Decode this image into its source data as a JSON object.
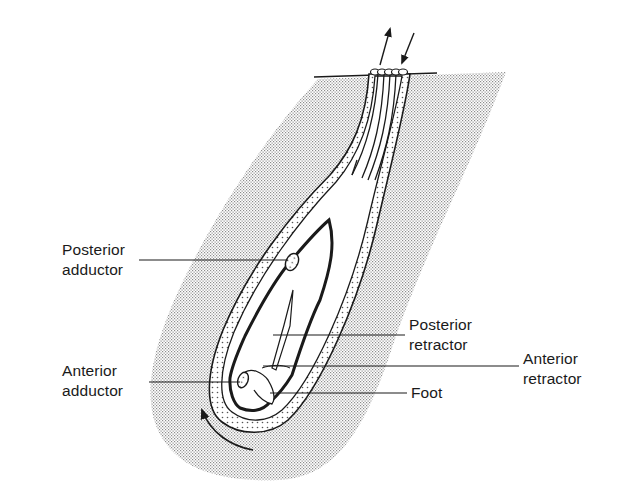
{
  "diagram": {
    "colors": {
      "background": "#ffffff",
      "ink": "#1a1a1a",
      "sediment_stipple": "#9a9a9a"
    },
    "labels": {
      "posterior_adductor": {
        "line1": "Posterior",
        "line2": "adductor"
      },
      "anterior_adductor": {
        "line1": "Anterior",
        "line2": "adductor"
      },
      "posterior_retractor": {
        "line1": "Posterior",
        "line2": "retractor"
      },
      "anterior_retractor": {
        "line1": "Anterior",
        "line2": "retractor"
      },
      "foot": {
        "line1": "Foot"
      }
    },
    "arrows": {
      "siphon_out": "exhalant flow arrow (up)",
      "siphon_in": "inhalant flow arrow (down)",
      "rotation": "curved arrow indicating rocking/rotation"
    }
  }
}
